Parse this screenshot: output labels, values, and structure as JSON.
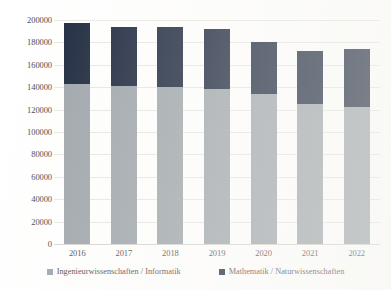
{
  "chart_data": {
    "type": "bar",
    "stacked": true,
    "title": "",
    "xlabel": "",
    "ylabel": "",
    "categories": [
      "2016",
      "2017",
      "2018",
      "2019",
      "2020",
      "2021",
      "2022"
    ],
    "series": [
      {
        "name": "Ingenieurwissenschaften / Informatik",
        "color": "#9ba2a8",
        "values": [
          143000,
          141000,
          140000,
          138000,
          134000,
          125000,
          122000
        ]
      },
      {
        "name": "Mathematik / Naturwissenschaften",
        "color": "#141f36",
        "values": [
          54000,
          53000,
          54000,
          54000,
          46000,
          47000,
          52000
        ]
      }
    ],
    "totals": [
      197000,
      194000,
      194000,
      192000,
      180000,
      172000,
      174000
    ],
    "ylim": [
      0,
      200000
    ],
    "yticks": [
      200000,
      180000,
      160000,
      140000,
      120000,
      100000,
      80000,
      60000,
      40000,
      20000,
      0
    ],
    "ytick_labels": [
      "200000",
      "180000",
      "160000",
      "140000",
      "120000",
      "100000",
      "80000",
      "60000",
      "40000",
      "20000",
      "0"
    ],
    "grid": true,
    "legend_position": "bottom"
  },
  "legend": {
    "items": [
      {
        "label": "Ingenieurwissenschaften / Informatik",
        "color": "#9ba2a8"
      },
      {
        "label": "Mathematik / Naturwissenschaften",
        "color": "#141f36"
      }
    ]
  }
}
